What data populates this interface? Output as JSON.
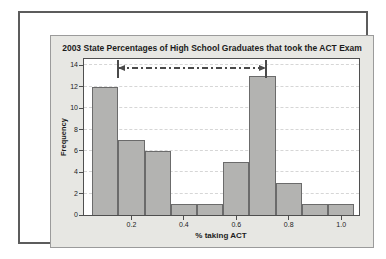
{
  "chart_data": {
    "type": "bar",
    "chart_style": "histogram",
    "title": "2003 State Percentages of High School Graduates that took the ACT Exam",
    "xlabel": "% taking ACT",
    "ylabel": "Frequency",
    "bin_centers": [
      0.1,
      0.2,
      0.3,
      0.4,
      0.5,
      0.6,
      0.7,
      0.8,
      0.9,
      1.0
    ],
    "bin_width": 0.1,
    "values": [
      12,
      7,
      6,
      1,
      1,
      5,
      13,
      3,
      1,
      1
    ],
    "total_count": 50,
    "x_tick_labels": [
      "0.2",
      "0.4",
      "0.6",
      "0.8",
      "1.0"
    ],
    "y_ticks": [
      0,
      2,
      4,
      6,
      8,
      10,
      12,
      14
    ],
    "xlim": [
      0.019,
      1.068
    ],
    "ylim": [
      0,
      14.6
    ],
    "grid": "horizontal-dashed-at-y-ticks",
    "legend": "none",
    "annotation": {
      "type": "double-headed-dash-dot-arrow-between-reference-lines",
      "x_start": 0.15,
      "x_end": 0.715,
      "y": 13.7,
      "ref_y_low": 12.85,
      "ref_y_high": 14.5
    },
    "colors": {
      "bar_fill": "#b3b3b1",
      "bar_border": "#6b6b6b",
      "panel_bg": "#e7e7e3",
      "plot_bg": "#ffffff",
      "grid": "#d6d6d6",
      "annotation": "#4a4a4a",
      "frame": "#4f4f4f",
      "text": "#1c1c1c"
    }
  }
}
